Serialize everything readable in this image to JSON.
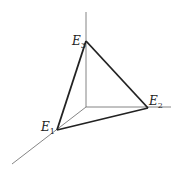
{
  "diagram": {
    "type": "3d-axes-triangle",
    "origin": [
      86,
      107
    ],
    "axes": {
      "vertical": {
        "from": [
          86,
          107
        ],
        "to": [
          86,
          12
        ]
      },
      "horizontal": {
        "from": [
          86,
          107
        ],
        "to": [
          171,
          107
        ]
      },
      "diagonal": {
        "from": [
          86,
          107
        ],
        "to": [
          12,
          164
        ]
      }
    },
    "vertices": [
      {
        "name": "E1",
        "letter": "E",
        "sub": "1",
        "pos": [
          57,
          130
        ],
        "label_pos": [
          40,
          130
        ]
      },
      {
        "name": "E2",
        "letter": "E",
        "sub": "2",
        "pos": [
          148,
          108
        ],
        "label_pos": [
          150,
          104
        ]
      },
      {
        "name": "E3",
        "letter": "E",
        "sub": "3",
        "pos": [
          86,
          41
        ],
        "label_pos": [
          72,
          44
        ]
      }
    ],
    "colors": {
      "axis": "#555555",
      "edge": "#222222"
    }
  }
}
